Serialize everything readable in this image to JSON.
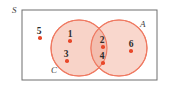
{
  "figure": {
    "kind": "venn-diagram",
    "universal_set_label": "S",
    "colors": {
      "circle_stroke": "#ef7a62",
      "circle_fill": "#f8d3c8",
      "intersection_fill": "#f3bdae",
      "point_color": "#e8482a",
      "label_color": "#3d3d3d",
      "number_color": "#2b2b2b",
      "rect_stroke": "#6e6e6e",
      "background": "#ffffff"
    },
    "rect": {
      "x": 22,
      "y": 10,
      "width": 135,
      "height": 70
    },
    "set_labels": [
      {
        "name": "universe-label-s",
        "text": "S",
        "x": 12,
        "y": 6
      },
      {
        "name": "set-label-a",
        "text": "A",
        "x": 140,
        "y": 20
      },
      {
        "name": "set-label-c",
        "text": "C",
        "x": 51,
        "y": 66
      }
    ],
    "circles": [
      {
        "name": "circle-c",
        "label": "C",
        "cx": 79,
        "cy": 48,
        "r": 28
      },
      {
        "name": "circle-a",
        "label": "A",
        "cx": 119,
        "cy": 48,
        "r": 28
      }
    ],
    "points": [
      {
        "name": "point-5",
        "label": "5",
        "nx": 39,
        "ny": 27,
        "dx": 40,
        "dy": 38,
        "region": "outside-both"
      },
      {
        "name": "point-1",
        "label": "1",
        "nx": 70,
        "ny": 30,
        "dx": 70,
        "dy": 41,
        "region": "C-only"
      },
      {
        "name": "point-3",
        "label": "3",
        "nx": 66,
        "ny": 50,
        "dx": 67,
        "dy": 61,
        "region": "C-only"
      },
      {
        "name": "point-2",
        "label": "2",
        "nx": 102,
        "ny": 36,
        "dx": 103,
        "dy": 47,
        "region": "A-and-C"
      },
      {
        "name": "point-4",
        "label": "4",
        "nx": 102,
        "ny": 52,
        "dx": 103,
        "dy": 63,
        "region": "A-and-C"
      },
      {
        "name": "point-6",
        "label": "6",
        "nx": 131,
        "ny": 40,
        "dx": 131,
        "dy": 51,
        "region": "A-only"
      }
    ]
  }
}
